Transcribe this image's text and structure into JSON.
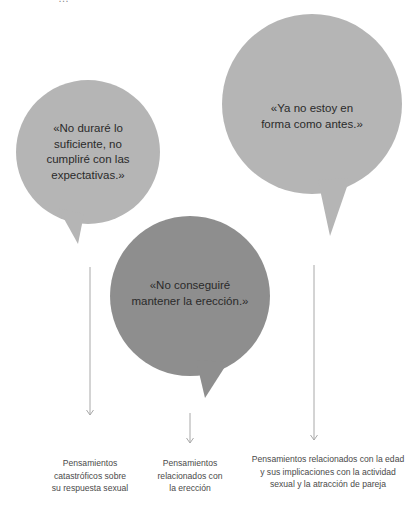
{
  "header": {
    "cut_off_text": "…"
  },
  "colors": {
    "bubble_light": "#b5b5b5",
    "bubble_dark": "#8e8e8e",
    "arrow": "#a8a8a8",
    "text": "#2a2a2a",
    "label_text": "#4a4a4a"
  },
  "bubbles": [
    {
      "id": "bubble-1",
      "quote": "«No duraré lo suficiente, no cumpliré con las expectativas.»",
      "lines": [
        "«No duraré lo",
        "suficiente, no",
        "cumpliré con las",
        "expectativas.»"
      ],
      "shade": "light"
    },
    {
      "id": "bubble-2",
      "quote": "«Ya no estoy en forma como antes.»",
      "lines": [
        "«Ya no estoy en",
        "forma como antes.»"
      ],
      "shade": "light"
    },
    {
      "id": "bubble-3",
      "quote": "«No conseguiré mantener la erección.»",
      "lines": [
        "«No conseguiré",
        "mantener la erección.»"
      ],
      "shade": "dark"
    }
  ],
  "labels": [
    {
      "lines": [
        "Pensamientos",
        "catastróficos sobre",
        "su respuesta sexual"
      ]
    },
    {
      "lines": [
        "Pensamientos",
        "relacionados con",
        "la erección"
      ]
    },
    {
      "lines": [
        "Pensamientos relacionados con la edad",
        "y sus implicaciones con la actividad",
        "sexual y la atracción de pareja"
      ]
    }
  ]
}
